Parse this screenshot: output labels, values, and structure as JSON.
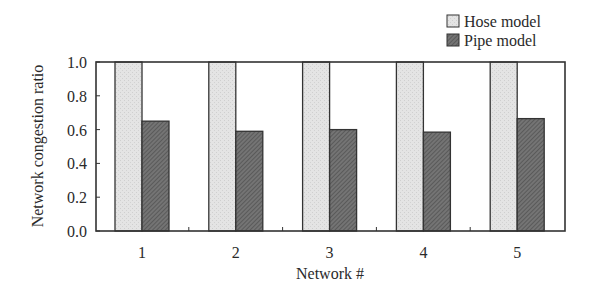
{
  "chart_data": {
    "type": "bar",
    "title": "",
    "xlabel": "Network #",
    "ylabel": "Network congestion ratio",
    "categories": [
      "1",
      "2",
      "3",
      "4",
      "5"
    ],
    "series": [
      {
        "name": "Hose model",
        "values": [
          1.0,
          1.0,
          1.0,
          1.0,
          1.0
        ],
        "color": "#e2e2e2"
      },
      {
        "name": "Pipe model",
        "values": [
          0.65,
          0.59,
          0.6,
          0.585,
          0.665
        ],
        "color": "#6e6e6e"
      }
    ],
    "ylim": [
      0.0,
      1.0
    ],
    "yticks": [
      "0.0",
      "0.2",
      "0.4",
      "0.6",
      "0.8",
      "1.0"
    ],
    "grid": false,
    "legend_position": "top-right"
  }
}
